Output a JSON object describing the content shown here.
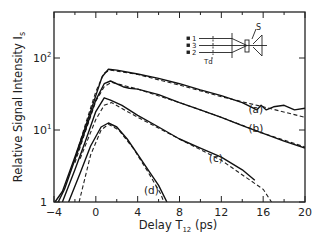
{
  "chart_data": {
    "type": "line",
    "title": "",
    "xlabel": "Delay T12 (ps)",
    "xlabel_main": "Delay",
    "xlabel_symbol": "T",
    "xlabel_sub": "12",
    "xlabel_unit": "(ps)",
    "ylabel": "Relative Signal Intensity Is",
    "ylabel_main": "Relative Signal Intensity I",
    "ylabel_sub": "s",
    "xlim": [
      -4,
      20
    ],
    "ylim": [
      1,
      251
    ],
    "yscale": "log",
    "grid": false,
    "x_ticks": [
      -4,
      0,
      4,
      8,
      12,
      16,
      20
    ],
    "x_minor_ticks": [
      -2,
      2,
      6,
      10,
      14,
      18
    ],
    "y_ticks": [
      {
        "value": 1,
        "label": "1"
      },
      {
        "value": 10,
        "label": "10",
        "exp": "1"
      },
      {
        "value": 100,
        "label": "10",
        "exp": "2"
      }
    ],
    "series": [
      {
        "name": "(a)",
        "style": "solid-measured-with-dashed-fit",
        "label_pos": [
          14.6,
          17
        ],
        "measured": [
          [
            -3.9,
            1.0
          ],
          [
            -3.2,
            1.4
          ],
          [
            -2,
            4.2
          ],
          [
            -1,
            11
          ],
          [
            0,
            30
          ],
          [
            0.6,
            55
          ],
          [
            1.2,
            70
          ],
          [
            2,
            68
          ],
          [
            4,
            60
          ],
          [
            6,
            52
          ],
          [
            8,
            44
          ],
          [
            10,
            36
          ],
          [
            12,
            30
          ],
          [
            14,
            24
          ],
          [
            15.4,
            19
          ],
          [
            15.8,
            22
          ],
          [
            16.3,
            19
          ],
          [
            17,
            21
          ],
          [
            18,
            22
          ],
          [
            19,
            19
          ],
          [
            20,
            20
          ]
        ],
        "fit": [
          [
            -2,
            4
          ],
          [
            -1,
            12
          ],
          [
            0,
            34
          ],
          [
            0.8,
            62
          ],
          [
            1.4,
            68
          ],
          [
            4,
            59
          ],
          [
            8,
            42
          ],
          [
            12,
            29
          ],
          [
            16,
            21
          ],
          [
            20,
            15
          ]
        ]
      },
      {
        "name": "(b)",
        "style": "solid-measured-with-dashed-fit",
        "label_pos": [
          14.6,
          9.5
        ],
        "measured": [
          [
            -3.6,
            1.0
          ],
          [
            -3,
            1.5
          ],
          [
            -2,
            3.9
          ],
          [
            -1,
            10
          ],
          [
            0,
            26
          ],
          [
            0.8,
            44
          ],
          [
            1.4,
            48
          ],
          [
            2.6,
            40
          ],
          [
            3.2,
            38
          ],
          [
            4,
            37
          ],
          [
            6,
            31
          ],
          [
            8,
            24
          ],
          [
            10,
            19
          ],
          [
            12,
            15
          ],
          [
            14,
            11.5
          ],
          [
            16,
            9
          ],
          [
            18,
            7
          ],
          [
            20,
            5.6
          ]
        ],
        "fit": [
          [
            -2,
            3.5
          ],
          [
            -1,
            9.5
          ],
          [
            0,
            25
          ],
          [
            0.8,
            40
          ],
          [
            1.5,
            46
          ],
          [
            4,
            37
          ],
          [
            8,
            24
          ],
          [
            12,
            15
          ],
          [
            16,
            9
          ],
          [
            20,
            5.8
          ]
        ]
      },
      {
        "name": "(c)",
        "style": "solid-measured-with-dashed-fit",
        "label_pos": [
          10.8,
          3.6
        ],
        "measured": [
          [
            -3.2,
            1.0
          ],
          [
            -2,
            2.8
          ],
          [
            -1,
            7
          ],
          [
            0,
            18
          ],
          [
            0.8,
            28
          ],
          [
            1.4,
            26
          ],
          [
            2.5,
            22
          ],
          [
            4,
            16
          ],
          [
            6,
            11
          ],
          [
            8,
            7.5
          ],
          [
            10,
            5.6
          ],
          [
            12,
            4.2
          ],
          [
            14,
            2.8
          ],
          [
            15.2,
            2.0
          ]
        ],
        "fit": [
          [
            -1.5,
            4
          ],
          [
            0,
            14
          ],
          [
            0.8,
            22
          ],
          [
            1.5,
            24
          ],
          [
            4,
            15
          ],
          [
            8,
            7.5
          ],
          [
            12,
            3.8
          ],
          [
            16,
            1.5
          ],
          [
            16.8,
            1.0
          ]
        ]
      },
      {
        "name": "(d)",
        "style": "solid-measured-with-dashed-fit",
        "label_pos": [
          4.6,
          1.3
        ],
        "measured": [
          [
            -2.6,
            1.0
          ],
          [
            -1.5,
            2.5
          ],
          [
            -0.5,
            6
          ],
          [
            0.5,
            11
          ],
          [
            1.2,
            12.5
          ],
          [
            2,
            11
          ],
          [
            3,
            7.5
          ],
          [
            4,
            4.6
          ],
          [
            5,
            2.8
          ],
          [
            6,
            1.7
          ],
          [
            6.8,
            1.0
          ]
        ],
        "fit": [
          [
            -1.6,
            1.0
          ],
          [
            -0.5,
            4.5
          ],
          [
            0.5,
            10
          ],
          [
            1.2,
            12
          ],
          [
            2.2,
            10
          ],
          [
            3.6,
            5.5
          ],
          [
            5,
            2.6
          ],
          [
            6.2,
            1.3
          ],
          [
            6.5,
            1.0
          ]
        ]
      }
    ],
    "inset": {
      "beam_labels": [
        "1",
        "3",
        "2"
      ],
      "sample_label": "S",
      "delay_label": "Td"
    }
  }
}
